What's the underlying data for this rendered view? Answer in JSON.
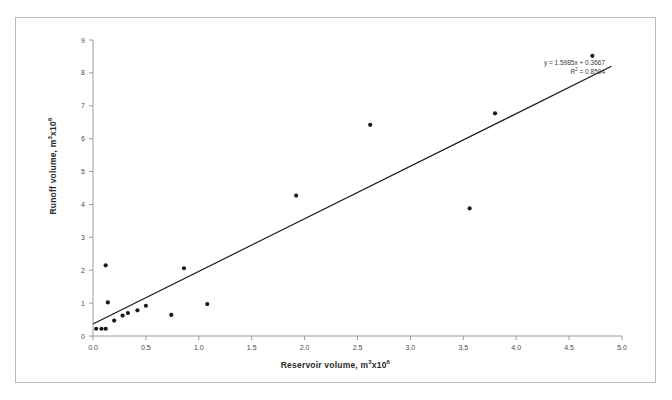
{
  "chart_data": {
    "type": "scatter",
    "title": "",
    "xlabel": "Reservoir volume, m3x106",
    "xlabel_parts": {
      "text": "Reservoir volume, m",
      "sup1": "3",
      "mid": "x10",
      "sup2": "6"
    },
    "ylabel": "Runoff volume, m3x106",
    "ylabel_parts": {
      "text": "Runoff volume, m",
      "sup1": "3",
      "mid": "x10",
      "sup2": "6"
    },
    "xlim": [
      0.0,
      5.0
    ],
    "ylim": [
      0,
      9
    ],
    "xticks": [
      "0.0",
      "0.5",
      "1.0",
      "1.5",
      "2.0",
      "2.5",
      "3.0",
      "3.5",
      "4.0",
      "4.5",
      "5.0"
    ],
    "xtick_values": [
      0.0,
      0.5,
      1.0,
      1.5,
      2.0,
      2.5,
      3.0,
      3.5,
      4.0,
      4.5,
      5.0
    ],
    "yticks": [
      "0",
      "1",
      "2",
      "3",
      "4",
      "5",
      "6",
      "7",
      "8",
      "9"
    ],
    "ytick_values": [
      0,
      1,
      2,
      3,
      4,
      5,
      6,
      7,
      8,
      9
    ],
    "grid": false,
    "legend": "none",
    "marker_color": "#1a1a1a",
    "line_color": "#1a1a1a",
    "axis_color": "#9a9a9a",
    "points": [
      {
        "x": 0.03,
        "y": 0.22
      },
      {
        "x": 0.08,
        "y": 0.22
      },
      {
        "x": 0.12,
        "y": 0.22
      },
      {
        "x": 0.12,
        "y": 2.15
      },
      {
        "x": 0.14,
        "y": 1.02
      },
      {
        "x": 0.2,
        "y": 0.47
      },
      {
        "x": 0.28,
        "y": 0.62
      },
      {
        "x": 0.33,
        "y": 0.7
      },
      {
        "x": 0.42,
        "y": 0.78
      },
      {
        "x": 0.5,
        "y": 0.92
      },
      {
        "x": 0.74,
        "y": 0.64
      },
      {
        "x": 0.86,
        "y": 2.06
      },
      {
        "x": 1.08,
        "y": 0.97
      },
      {
        "x": 1.92,
        "y": 4.27
      },
      {
        "x": 2.62,
        "y": 6.42
      },
      {
        "x": 3.56,
        "y": 3.88
      },
      {
        "x": 3.8,
        "y": 6.77
      },
      {
        "x": 4.72,
        "y": 8.52
      }
    ],
    "trendline": {
      "slope": 1.5985,
      "intercept": 0.3667,
      "r_squared": 0.8594,
      "equation_label": "y = 1.5985x + 0.3667",
      "r2_label": "R2 = 0.8594",
      "r2_prefix": "R",
      "r2_sup": "2",
      "r2_suffix": " = 0.8594",
      "x_start": 0.0,
      "x_end": 4.9
    }
  }
}
